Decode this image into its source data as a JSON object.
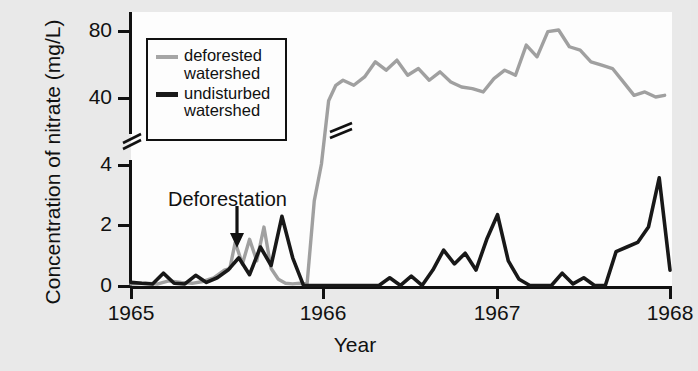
{
  "chart_data": {
    "type": "line",
    "title": "",
    "xlabel": "Year",
    "ylabel": "Concentration of nitrate (mg/L)",
    "xlim": [
      1965,
      1968
    ],
    "xticks": [
      1965,
      1966,
      1967,
      1968
    ],
    "xtick_labels": [
      "1965",
      "1966",
      "1967",
      "1968"
    ],
    "yticks": [
      0,
      2,
      4,
      40,
      80
    ],
    "ytick_labels": [
      "0",
      "2",
      "4",
      "40",
      "80"
    ],
    "y_axis_break": true,
    "y_axis_break_between": [
      4,
      40
    ],
    "grid": false,
    "legend_position": "upper-left",
    "colors": {
      "deforested": "#a0a0a0",
      "undisturbed": "#181818",
      "axis": "#111111",
      "panel_background": "#fdfdfd",
      "figure_background": "#e9e9e9"
    },
    "annotations": [
      {
        "text": "Deforestation",
        "x": 1965.55,
        "y": 3.1,
        "arrow": true
      }
    ],
    "series": [
      {
        "name": "deforested watershed",
        "color": "#a0a0a0",
        "x": [
          1965.0,
          1965.08,
          1965.15,
          1965.21,
          1965.28,
          1965.34,
          1965.4,
          1965.46,
          1965.52,
          1965.55,
          1965.58,
          1965.62,
          1965.66,
          1965.7,
          1965.74,
          1965.78,
          1965.82,
          1965.86,
          1965.9,
          1965.94,
          1965.98,
          1966.02,
          1966.06,
          1966.1,
          1966.14,
          1966.18,
          1966.24,
          1966.3,
          1966.36,
          1966.42,
          1966.48,
          1966.54,
          1966.6,
          1966.66,
          1966.72,
          1966.78,
          1966.84,
          1966.9,
          1966.96,
          1967.02,
          1967.08,
          1967.14,
          1967.2,
          1967.26,
          1967.32,
          1967.38,
          1967.44,
          1967.5,
          1967.56,
          1967.62,
          1967.68,
          1967.74,
          1967.8,
          1967.86,
          1967.92,
          1967.97
        ],
        "y": [
          0.1,
          0.12,
          0.1,
          0.2,
          0.15,
          0.12,
          0.18,
          0.3,
          0.55,
          0.6,
          1.45,
          0.75,
          1.55,
          0.85,
          1.95,
          0.6,
          0.25,
          0.12,
          0.1,
          0.12,
          0.1,
          2.8,
          4.0,
          38.0,
          47.0,
          50.0,
          47.0,
          52.0,
          61.0,
          56.0,
          62.0,
          53.0,
          57.0,
          50.0,
          55.0,
          49.0,
          46.0,
          45.0,
          43.0,
          51.0,
          56.0,
          53.0,
          71.0,
          64.0,
          79.0,
          80.0,
          70.0,
          68.0,
          61.0,
          59.0,
          57.0,
          49.0,
          41.0,
          43.0,
          40.0,
          41.0
        ]
      },
      {
        "name": "undisturbed watershed",
        "color": "#181818",
        "x": [
          1965.0,
          1965.06,
          1965.12,
          1965.18,
          1965.24,
          1965.3,
          1965.36,
          1965.42,
          1965.48,
          1965.54,
          1965.6,
          1965.66,
          1965.72,
          1965.78,
          1965.84,
          1965.9,
          1965.96,
          1966.02,
          1966.08,
          1966.14,
          1966.2,
          1966.26,
          1966.32,
          1966.38,
          1966.44,
          1966.5,
          1966.56,
          1966.62,
          1966.68,
          1966.74,
          1966.8,
          1966.86,
          1966.92,
          1966.98,
          1967.04,
          1967.1,
          1967.16,
          1967.22,
          1967.28,
          1967.34,
          1967.4,
          1967.46,
          1967.52,
          1967.58,
          1967.64,
          1967.7,
          1967.76,
          1967.82,
          1967.88,
          1967.94,
          1968.0
        ],
        "y": [
          0.15,
          0.12,
          0.1,
          0.45,
          0.12,
          0.1,
          0.38,
          0.15,
          0.3,
          0.55,
          0.95,
          0.4,
          1.3,
          0.7,
          2.3,
          0.95,
          0.05,
          0.05,
          0.05,
          0.05,
          0.05,
          0.05,
          0.05,
          0.05,
          0.3,
          0.05,
          0.35,
          0.05,
          0.55,
          1.2,
          0.75,
          1.1,
          0.55,
          1.55,
          2.35,
          0.85,
          0.25,
          0.05,
          0.05,
          0.05,
          0.45,
          0.1,
          0.3,
          0.05,
          0.05,
          1.15,
          1.3,
          1.45,
          1.95,
          3.55,
          0.55
        ]
      }
    ]
  },
  "legend": {
    "items": [
      {
        "label_line1": "deforested",
        "label_line2": "watershed",
        "swatch": "deforested"
      },
      {
        "label_line1": "undisturbed",
        "label_line2": "watershed",
        "swatch": "undisturbed"
      }
    ]
  },
  "axes": {
    "y_title": "Concentration of nitrate (mg/L)",
    "x_title": "Year",
    "y_labels": [
      "80",
      "40",
      "4",
      "2",
      "0"
    ],
    "x_labels": [
      "1965",
      "1966",
      "1967",
      "1968"
    ]
  },
  "annotation": {
    "label": "Deforestation",
    "arrow_icon": "down-arrow-icon"
  }
}
